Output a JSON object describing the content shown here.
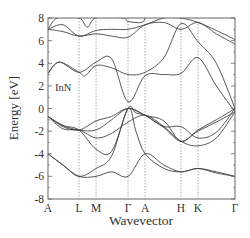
{
  "chart_data": {
    "type": "line",
    "title": "",
    "material_label": "InN",
    "xlabel": "Wavevector",
    "ylabel": "Energy [eV]",
    "ylim": [
      -8,
      8
    ],
    "yticks": [
      -8,
      -6,
      -4,
      -2,
      0,
      2,
      4,
      6,
      8
    ],
    "xticks": [
      {
        "label": "A",
        "pos": 0.0
      },
      {
        "label": "L",
        "pos": 0.166
      },
      {
        "label": "M",
        "pos": 0.257
      },
      {
        "label": "Γ",
        "pos": 0.428
      },
      {
        "label": "A",
        "pos": 0.519
      },
      {
        "label": "H",
        "pos": 0.711
      },
      {
        "label": "K",
        "pos": 0.802
      },
      {
        "label": "Γ",
        "pos": 1.0
      }
    ],
    "grid": "dashed vertical lines at interior high-symmetry points",
    "legend": "none",
    "series": [
      {
        "name": "valence band 1",
        "x": [
          0,
          0.08,
          0.166,
          0.257,
          0.34,
          0.428,
          0.47,
          0.519,
          0.62,
          0.711,
          0.802,
          0.9,
          1.0
        ],
        "values": [
          -4.0,
          -5.0,
          -6.0,
          -5.3,
          -4.2,
          0.0,
          -2.0,
          -4.0,
          -5.3,
          -5.6,
          -5.3,
          -5.6,
          -6.0
        ]
      },
      {
        "name": "valence band 2",
        "x": [
          0,
          0.08,
          0.166,
          0.257,
          0.34,
          0.428,
          0.519,
          0.62,
          0.711,
          0.802,
          0.9,
          1.0
        ],
        "values": [
          -4.0,
          -5.0,
          -6.0,
          -6.0,
          -5.6,
          -6.0,
          -4.0,
          -5.0,
          -5.6,
          -5.3,
          -5.7,
          -6.0
        ]
      },
      {
        "name": "valence band 3",
        "x": [
          0,
          0.08,
          0.166,
          0.257,
          0.34,
          0.428,
          0.47,
          0.519,
          0.62,
          0.711,
          0.802,
          0.9,
          1.0
        ],
        "values": [
          -0.7,
          -1.5,
          -1.9,
          -3.6,
          -3.8,
          0.0,
          -0.4,
          -0.6,
          -1.6,
          -1.6,
          -2.6,
          -2.1,
          0.0
        ]
      },
      {
        "name": "valence band 4",
        "x": [
          0,
          0.08,
          0.166,
          0.257,
          0.34,
          0.428,
          0.519,
          0.62,
          0.711,
          0.802,
          0.9,
          1.0
        ],
        "values": [
          -0.7,
          -1.8,
          -1.9,
          -2.6,
          -2.2,
          -1.2,
          -0.6,
          -1.6,
          -2.9,
          -3.3,
          -2.6,
          -0.3
        ]
      },
      {
        "name": "valence band 5",
        "x": [
          0,
          0.08,
          0.166,
          0.257,
          0.34,
          0.428,
          0.519,
          0.62,
          0.711,
          0.802,
          0.9,
          1.0
        ],
        "values": [
          -0.7,
          -1.6,
          -1.9,
          -1.1,
          -0.7,
          0.0,
          -0.6,
          -1.1,
          -2.9,
          -1.9,
          -1.0,
          0.0
        ]
      },
      {
        "name": "valence band 6",
        "x": [
          0,
          0.08,
          0.166,
          0.257,
          0.34,
          0.428,
          0.519,
          0.62,
          0.711,
          0.802,
          0.9,
          1.0
        ],
        "values": [
          -0.7,
          -1.5,
          -1.9,
          -1.9,
          -1.0,
          0.0,
          -0.6,
          -1.7,
          -2.9,
          -2.0,
          -1.2,
          -0.3
        ]
      },
      {
        "name": "conduction band 1",
        "x": [
          0,
          0.06,
          0.166,
          0.257,
          0.34,
          0.428,
          0.519,
          0.62,
          0.711,
          0.802,
          0.9,
          1.0
        ],
        "values": [
          3.1,
          4.1,
          3.2,
          4.1,
          4.4,
          0.6,
          2.9,
          3.0,
          3.1,
          4.5,
          2.0,
          -0.3
        ]
      },
      {
        "name": "conduction band 2",
        "x": [
          0,
          0.06,
          0.166,
          0.2,
          0.257,
          0.34,
          0.428,
          0.519,
          0.62,
          0.711,
          0.802,
          0.9,
          1.0
        ],
        "values": [
          3.1,
          4.1,
          3.2,
          2.9,
          3.8,
          3.6,
          3.0,
          3.2,
          4.5,
          7.5,
          5.9,
          4.0,
          0.0
        ]
      },
      {
        "name": "conduction band 3",
        "x": [
          0,
          0.08,
          0.166,
          0.257,
          0.34,
          0.428,
          0.519,
          0.62,
          0.711,
          0.802,
          0.9,
          1.0
        ],
        "values": [
          7.0,
          6.8,
          6.4,
          6.6,
          6.4,
          6.3,
          7.4,
          7.6,
          7.0,
          7.6,
          6.6,
          5.7
        ]
      },
      {
        "name": "conduction band 4",
        "x": [
          0,
          0.08,
          0.166,
          0.257,
          0.34,
          0.428,
          0.519,
          0.62,
          0.711,
          0.802,
          0.9,
          1.0
        ],
        "values": [
          7.0,
          7.4,
          6.4,
          6.9,
          7.0,
          7.0,
          7.4,
          8.0,
          8.0,
          7.6,
          6.9,
          6.1
        ]
      },
      {
        "name": "conduction band 5",
        "x": [
          0,
          0.05,
          0.166,
          0.21,
          0.257,
          0.4,
          0.428,
          0.5,
          0.519
        ],
        "values": [
          7.0,
          8.0,
          8.0,
          7.2,
          8.0,
          8.0,
          7.7,
          7.6,
          8.0
        ]
      }
    ]
  }
}
